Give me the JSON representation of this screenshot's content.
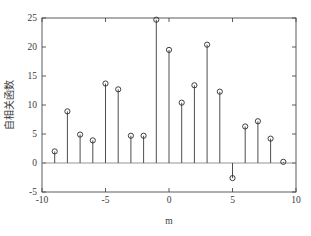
{
  "chart_data": {
    "type": "scatter",
    "subtype": "stem",
    "title": "",
    "xlabel": "m",
    "ylabel": "自相关函数",
    "xlim": [
      -10,
      10
    ],
    "ylim": [
      -5,
      25
    ],
    "xticks": [
      -10,
      -5,
      0,
      5,
      10
    ],
    "xticklabels": [
      "-10",
      "-5",
      "0",
      "5",
      "10"
    ],
    "yticks": [
      -5,
      0,
      5,
      10,
      15,
      20,
      25
    ],
    "yticklabels": [
      "-5",
      "0",
      "5",
      "10",
      "15",
      "20",
      "25"
    ],
    "grid": false,
    "legend": null,
    "marker": "circle-open",
    "baseline": 0,
    "x": [
      -9,
      -8,
      -7,
      -6,
      -5,
      -4,
      -3,
      -2,
      -1,
      0,
      1,
      2,
      3,
      4,
      5,
      6,
      7,
      8,
      9
    ],
    "values": [
      2.0,
      8.9,
      4.9,
      3.9,
      13.7,
      12.7,
      4.7,
      4.7,
      24.7,
      19.5,
      10.4,
      13.4,
      20.4,
      12.3,
      -2.6,
      6.3,
      7.2,
      4.2,
      0.2
    ],
    "series": [
      {
        "name": "自相关函数",
        "values": [
          2.0,
          8.9,
          4.9,
          3.9,
          13.7,
          12.7,
          4.7,
          4.7,
          24.7,
          19.5,
          10.4,
          13.4,
          20.4,
          12.3,
          -2.6,
          6.3,
          7.2,
          4.2,
          0.2
        ]
      }
    ],
    "colors": {
      "stem": "#3a3a3a",
      "marker": "#2a2a2a",
      "axis": "#4a4a4a",
      "baseline": "#8a8a8a",
      "background": "#ffffff"
    }
  }
}
